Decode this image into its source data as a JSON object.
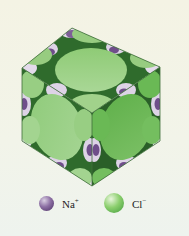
{
  "figure": {
    "colors": {
      "background": "#f3f4e8",
      "cl_face_light": "#9fd08a",
      "cl_face_mid": "#86c46e",
      "cl_face_dark": "#5fae4a",
      "na": "#7e5f97",
      "na_light": "#ddd3e6",
      "edge": "#3a6d3a"
    }
  },
  "legend": {
    "items": [
      {
        "symbol": "Na",
        "charge": "+",
        "label": "Na+",
        "color": "#6b4f86"
      },
      {
        "symbol": "Cl",
        "charge": "−",
        "label": "Cl−",
        "color": "#7cc55e"
      }
    ]
  }
}
